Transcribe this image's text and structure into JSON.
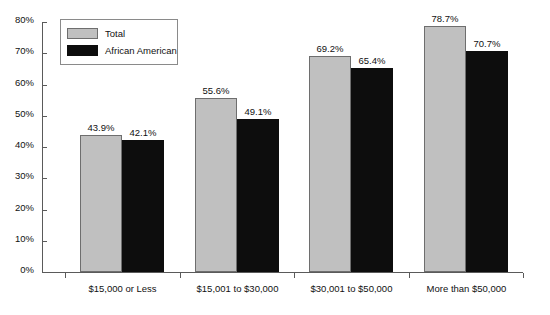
{
  "chart_data": {
    "type": "bar",
    "title": "",
    "xlabel": "",
    "ylabel": "",
    "categories": [
      "$15,000 or Less",
      "$15,001 to $30,000",
      "$30,001 to $50,000",
      "More than $50,000"
    ],
    "series": [
      {
        "name": "Total",
        "color": "#c0c0c0",
        "values": [
          43.9,
          42.1,
          69.2,
          78.7
        ],
        "labels": [
          "43.9%",
          "55.6%",
          "69.2%",
          "78.7%"
        ]
      },
      {
        "name": "African American",
        "color": "#0d0d0d",
        "values": [
          42.1,
          49.1,
          65.4,
          70.7
        ],
        "labels": [
          "42.1%",
          "49.1%",
          "65.4%",
          "70.7%"
        ]
      }
    ],
    "groups": [
      {
        "category": "$15,000 or Less",
        "total": 43.9,
        "african_american": 42.1,
        "total_label": "43.9%",
        "african_american_label": "42.1%"
      },
      {
        "category": "$15,001 to $30,000",
        "total": 55.6,
        "african_american": 49.1,
        "total_label": "55.6%",
        "african_american_label": "49.1%"
      },
      {
        "category": "$30,001 to $50,000",
        "total": 69.2,
        "african_american": 65.4,
        "total_label": "69.2%",
        "african_american_label": "65.4%"
      },
      {
        "category": "More than $50,000",
        "total": 78.7,
        "african_american": 70.7,
        "total_label": "78.7%",
        "african_american_label": "70.7%"
      }
    ],
    "ylim": [
      0,
      80
    ],
    "ytick_step": 10,
    "ytick_labels": [
      "0%",
      "10%",
      "20%",
      "30%",
      "40%",
      "50%",
      "60%",
      "70%",
      "80%"
    ],
    "grid": false,
    "legend_position": "top-left-inside"
  },
  "legend": {
    "items": [
      {
        "label": "Total"
      },
      {
        "label": "African American"
      }
    ]
  },
  "axes": {
    "y_ticks": [
      "0%",
      "10%",
      "20%",
      "30%",
      "40%",
      "50%",
      "60%",
      "70%",
      "80%"
    ],
    "x_labels": [
      "$15,000 or Less",
      "$15,001 to $30,000",
      "$30,001 to $50,000",
      "More than $50,000"
    ]
  },
  "footnote": {
    "text": ""
  }
}
